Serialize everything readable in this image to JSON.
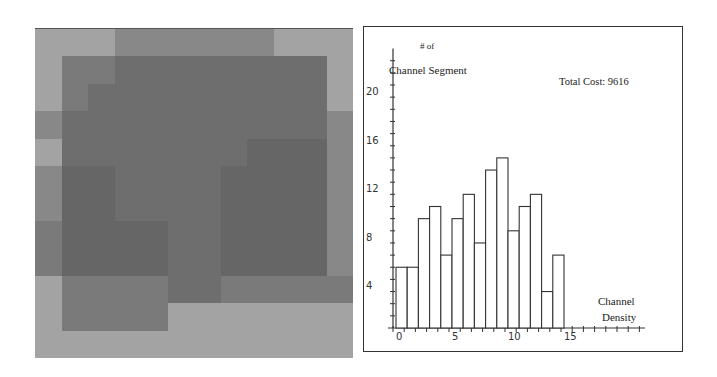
{
  "heatmap": {
    "name": "channel-density-map",
    "rows": 12,
    "cols": 12,
    "levels": [
      [
        5,
        5,
        5,
        4,
        4,
        4,
        4,
        4,
        4,
        5,
        5,
        5
      ],
      [
        5,
        3,
        3,
        2,
        2,
        2,
        2,
        2,
        2,
        2,
        2,
        5
      ],
      [
        5,
        3,
        2,
        2,
        2,
        2,
        2,
        2,
        2,
        2,
        2,
        5
      ],
      [
        4,
        2,
        2,
        2,
        2,
        2,
        2,
        2,
        2,
        2,
        2,
        4
      ],
      [
        5,
        2,
        2,
        2,
        2,
        2,
        2,
        2,
        1,
        1,
        1,
        4
      ],
      [
        4,
        1,
        1,
        2,
        2,
        2,
        2,
        1,
        1,
        1,
        1,
        4
      ],
      [
        4,
        1,
        1,
        2,
        2,
        2,
        2,
        1,
        1,
        1,
        1,
        4
      ],
      [
        3,
        1,
        1,
        1,
        1,
        2,
        2,
        1,
        1,
        1,
        1,
        4
      ],
      [
        3,
        1,
        1,
        1,
        1,
        2,
        2,
        1,
        1,
        1,
        1,
        4
      ],
      [
        5,
        3,
        3,
        3,
        3,
        2,
        2,
        3,
        3,
        3,
        3,
        3
      ],
      [
        5,
        3,
        3,
        3,
        3,
        5,
        5,
        5,
        5,
        5,
        5,
        5
      ],
      [
        5,
        5,
        5,
        5,
        5,
        5,
        5,
        5,
        5,
        5,
        5,
        5
      ]
    ],
    "palette": [
      "#5a5a5a",
      "#666666",
      "#6e6e6e",
      "#7a7a7a",
      "#888888",
      "#a3a3a3"
    ]
  },
  "chart_data": {
    "type": "bar",
    "title": "",
    "ylabel": "# of Channel Segment",
    "xlabel": "Channel Density",
    "annotation": "Total Cost: 9616",
    "categories": [
      0,
      1,
      2,
      3,
      4,
      5,
      6,
      7,
      8,
      9,
      10,
      11,
      12,
      13,
      14
    ],
    "values": [
      5,
      5,
      9,
      10,
      6,
      9,
      11,
      7,
      13,
      14,
      8,
      10,
      11,
      3,
      6
    ],
    "x_ticks": [
      0,
      5,
      10,
      15
    ],
    "y_ticks": [
      4,
      8,
      12,
      16,
      20
    ],
    "xlim": [
      0,
      22
    ],
    "ylim": [
      0,
      22
    ],
    "grid": false,
    "bar_fill": "#ffffff",
    "bar_stroke": "#333333"
  },
  "labels": {
    "ylabel_line1": "# of",
    "ylabel_line2": "Channel Segment",
    "annotation": "Total Cost: 9616",
    "xlabel_line1": "Channel",
    "xlabel_line2": "Density"
  }
}
